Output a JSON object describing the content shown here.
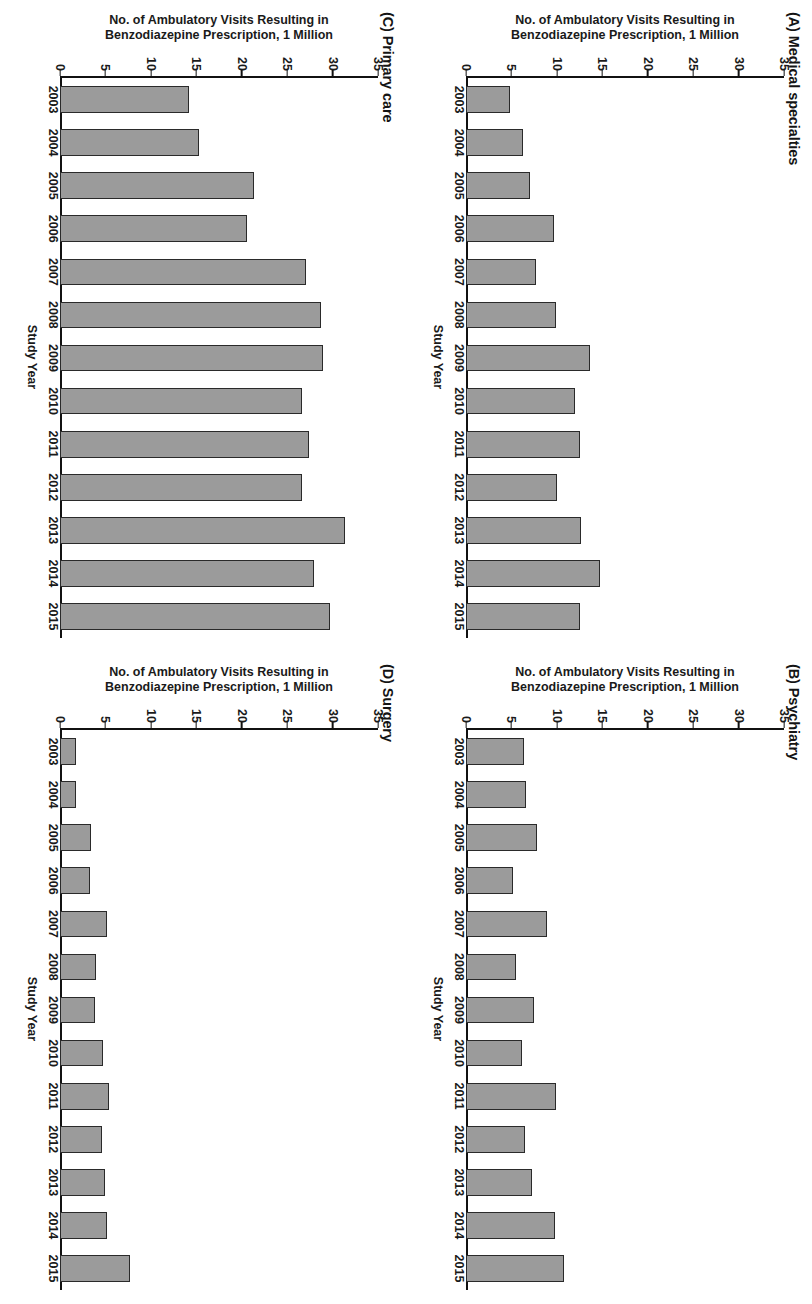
{
  "figure": {
    "x_axis_label": "Study Year",
    "y_axis_label_line1": "No. of Ambulatory Visits Resulting in",
    "y_axis_label_line2": "Benzodiazepine Prescription, 1 Million",
    "y_ticks": [
      "35",
      "30",
      "25",
      "20",
      "15",
      "10",
      "5",
      "0"
    ],
    "x_ticks": [
      "2003",
      "2004",
      "2005",
      "2006",
      "2007",
      "2008",
      "2009",
      "2010",
      "2011",
      "2012",
      "2013",
      "2014",
      "2015"
    ],
    "bar_fill_color": "#9b9b9b",
    "bar_border_color": "#2a2a2a",
    "axis_color": "#111111"
  },
  "panels": {
    "a": {
      "title": "(A) Medical specialties"
    },
    "b": {
      "title": "(B) Psychiatry"
    },
    "c": {
      "title": "(C) Primary care"
    },
    "d": {
      "title": "(D) Surgery"
    }
  },
  "chart_data": [
    {
      "type": "bar",
      "panel": "A",
      "title": "(A) Medical specialties",
      "xlabel": "Study Year",
      "ylabel": "No. of Ambulatory Visits Resulting in Benzodiazepine Prescription, 1 Million",
      "categories": [
        "2003",
        "2004",
        "2005",
        "2006",
        "2007",
        "2008",
        "2009",
        "2010",
        "2011",
        "2012",
        "2013",
        "2014",
        "2015"
      ],
      "values": [
        4.8,
        6.3,
        7.0,
        9.7,
        7.7,
        9.9,
        13.7,
        12.0,
        12.6,
        10.0,
        12.7,
        14.7,
        12.6
      ],
      "ylim": [
        0,
        35
      ],
      "yticks": [
        0,
        5,
        10,
        15,
        20,
        25,
        30,
        35
      ],
      "grid": false,
      "legend": "none"
    },
    {
      "type": "bar",
      "panel": "B",
      "title": "(B) Psychiatry",
      "xlabel": "Study Year",
      "ylabel": "No. of Ambulatory Visits Resulting in Benzodiazepine Prescription, 1 Million",
      "categories": [
        "2003",
        "2004",
        "2005",
        "2006",
        "2007",
        "2008",
        "2009",
        "2010",
        "2011",
        "2012",
        "2013",
        "2014",
        "2015"
      ],
      "values": [
        6.4,
        6.6,
        7.8,
        5.2,
        8.9,
        5.5,
        7.5,
        6.2,
        9.9,
        6.5,
        7.3,
        9.8,
        10.8
      ],
      "ylim": [
        0,
        35
      ],
      "yticks": [
        0,
        5,
        10,
        15,
        20,
        25,
        30,
        35
      ],
      "grid": false,
      "legend": "none"
    },
    {
      "type": "bar",
      "panel": "C",
      "title": "(C) Primary care",
      "xlabel": "Study Year",
      "ylabel": "No. of Ambulatory Visits Resulting in Benzodiazepine Prescription, 1 Million",
      "categories": [
        "2003",
        "2004",
        "2005",
        "2006",
        "2007",
        "2008",
        "2009",
        "2010",
        "2011",
        "2012",
        "2013",
        "2014",
        "2015"
      ],
      "values": [
        14.2,
        15.3,
        21.3,
        20.6,
        27.1,
        28.7,
        28.9,
        26.6,
        27.4,
        26.6,
        31.4,
        28.0,
        29.7
      ],
      "ylim": [
        0,
        35
      ],
      "yticks": [
        0,
        5,
        10,
        15,
        20,
        25,
        30,
        35
      ],
      "grid": false,
      "legend": "none"
    },
    {
      "type": "bar",
      "panel": "D",
      "title": "(D) Surgery",
      "xlabel": "Study Year",
      "ylabel": "No. of Ambulatory Visits Resulting in Benzodiazepine Prescription, 1 Million",
      "categories": [
        "2003",
        "2004",
        "2005",
        "2006",
        "2007",
        "2008",
        "2009",
        "2010",
        "2011",
        "2012",
        "2013",
        "2014",
        "2015"
      ],
      "values": [
        1.8,
        1.8,
        3.4,
        3.3,
        5.2,
        4.0,
        3.8,
        4.7,
        5.4,
        4.6,
        5.0,
        5.2,
        7.7
      ],
      "ylim": [
        0,
        35
      ],
      "yticks": [
        0,
        5,
        10,
        15,
        20,
        25,
        30,
        35
      ],
      "grid": false,
      "legend": "none"
    }
  ]
}
